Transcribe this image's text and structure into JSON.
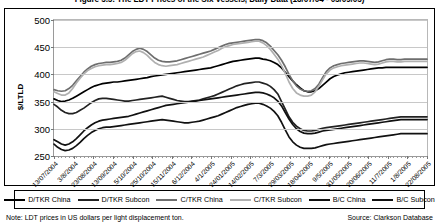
{
  "figure": {
    "title": "Figure 5.5: The LDT Prices of the Six Vessels, Daily Data (13/07/04 - 05/09/05)",
    "footnote_left": "Note: LDT prices in US dollars per light displacement ton.",
    "footnote_right": "Source: Clarkson Database"
  },
  "chart_data": {
    "type": "line",
    "title": "Figure 5.5: The LDT Prices of the Six Vessels, Daily Data (13/07/04 - 05/09/05)",
    "xlabel": "",
    "ylabel": "$/LTLD",
    "ylim": [
      250,
      500
    ],
    "yticks": [
      250,
      300,
      350,
      400,
      450,
      500
    ],
    "grid": true,
    "legend_position": "bottom",
    "x_tick_labels": [
      "13/07/2004",
      "3/8/2004",
      "23/08/2004",
      "13/09/2004",
      "5/10/2004",
      "25/10/2004",
      "15/11/2004",
      "6/12/2004",
      "4/1/2005",
      "24/01/2005",
      "14/02/2005",
      "7/3/2005",
      "29/03/2005",
      "18/04/2005",
      "9/5/2005",
      "31/05/2005",
      "20/06/2005",
      "11/7/2005",
      "1/8/2005",
      "22/08/2005"
    ],
    "x_tick_positions": [
      0,
      5.26,
      10.53,
      15.79,
      21.05,
      26.32,
      31.58,
      36.84,
      42.11,
      47.37,
      52.63,
      57.89,
      63.16,
      68.42,
      73.68,
      78.95,
      84.21,
      89.47,
      94.74,
      100
    ],
    "series": [
      {
        "name": "D/TKR China",
        "color": "#000000",
        "width": 1.7,
        "values": [
          355,
          352,
          350,
          351,
          353,
          356,
          360,
          364,
          368,
          372,
          376,
          379,
          381,
          383,
          384,
          385,
          386,
          386,
          387,
          388,
          389,
          390,
          391,
          392,
          393,
          394,
          396,
          397,
          398,
          399,
          400,
          401,
          402,
          403,
          404,
          405,
          406,
          407,
          408,
          409,
          410,
          411,
          412,
          414,
          416,
          418,
          420,
          422,
          424,
          425,
          426,
          427,
          428,
          429,
          430,
          430,
          428,
          427,
          425,
          422,
          418,
          412,
          404,
          396,
          388,
          381,
          375,
          370,
          368,
          368,
          370,
          374,
          380,
          386,
          392,
          396,
          399,
          401,
          403,
          404,
          405,
          406,
          407,
          408,
          409,
          410,
          411,
          412,
          412,
          413,
          413,
          413,
          413,
          413,
          413,
          413,
          413,
          413,
          413,
          413,
          413
        ]
      },
      {
        "name": "D/TKR Subcon",
        "color": "#222222",
        "width": 1.7,
        "values": [
          345,
          340,
          334,
          330,
          328,
          328,
          330,
          334,
          338,
          343,
          348,
          352,
          355,
          356,
          356,
          355,
          354,
          353,
          352,
          351,
          351,
          352,
          353,
          354,
          355,
          356,
          357,
          358,
          359,
          360,
          358,
          356,
          354,
          352,
          351,
          350,
          350,
          351,
          352,
          353,
          355,
          357,
          359,
          361,
          364,
          367,
          370,
          373,
          376,
          379,
          381,
          383,
          384,
          385,
          386,
          386,
          384,
          382,
          378,
          372,
          364,
          350,
          336,
          322,
          312,
          305,
          300,
          297,
          296,
          296,
          297,
          299,
          301,
          302,
          303,
          304,
          305,
          306,
          307,
          308,
          309,
          310,
          311,
          312,
          313,
          314,
          315,
          316,
          317,
          318,
          319,
          320,
          321,
          322,
          322,
          322,
          322,
          322,
          322,
          322,
          322
        ]
      },
      {
        "name": "C/TKR China",
        "color": "#6e6e6e",
        "width": 1.7,
        "values": [
          372,
          370,
          369,
          370,
          374,
          380,
          388,
          396,
          404,
          410,
          415,
          418,
          420,
          421,
          422,
          422,
          423,
          424,
          426,
          430,
          436,
          442,
          446,
          448,
          446,
          442,
          436,
          430,
          426,
          424,
          423,
          423,
          424,
          425,
          427,
          429,
          431,
          433,
          435,
          437,
          439,
          441,
          443,
          446,
          449,
          452,
          455,
          457,
          458,
          459,
          460,
          461,
          462,
          463,
          464,
          464,
          462,
          458,
          452,
          444,
          436,
          426,
          414,
          400,
          388,
          379,
          373,
          370,
          369,
          370,
          374,
          382,
          394,
          405,
          412,
          416,
          418,
          420,
          421,
          422,
          423,
          424,
          425,
          425,
          424,
          423,
          422,
          423,
          425,
          427,
          428,
          428,
          427,
          427,
          428,
          428,
          428,
          428,
          428,
          428,
          428
        ]
      },
      {
        "name": "C/TKR Subcon",
        "color": "#b0b0b0",
        "width": 1.7,
        "values": [
          368,
          365,
          362,
          362,
          366,
          374,
          384,
          393,
          401,
          407,
          411,
          414,
          416,
          417,
          418,
          418,
          419,
          420,
          422,
          426,
          432,
          438,
          442,
          443,
          440,
          435,
          428,
          422,
          418,
          416,
          415,
          416,
          417,
          418,
          420,
          422,
          424,
          426,
          428,
          430,
          432,
          435,
          438,
          441,
          444,
          448,
          451,
          453,
          455,
          456,
          457,
          458,
          459,
          460,
          461,
          461,
          458,
          453,
          446,
          437,
          428,
          416,
          402,
          386,
          374,
          366,
          362,
          360,
          360,
          362,
          368,
          378,
          390,
          401,
          408,
          412,
          414,
          416,
          417,
          418,
          419,
          420,
          421,
          421,
          420,
          419,
          418,
          419,
          421,
          423,
          424,
          424,
          423,
          423,
          424,
          424,
          424,
          424,
          424,
          424,
          424
        ]
      },
      {
        "name": "B/C China",
        "color": "#111111",
        "width": 1.7,
        "values": [
          280,
          276,
          272,
          270,
          272,
          276,
          282,
          289,
          296,
          302,
          307,
          311,
          314,
          316,
          317,
          318,
          319,
          320,
          321,
          322,
          323,
          325,
          327,
          329,
          331,
          333,
          335,
          337,
          339,
          341,
          343,
          344,
          345,
          346,
          347,
          348,
          349,
          350,
          351,
          352,
          353,
          354,
          355,
          356,
          357,
          358,
          359,
          360,
          361,
          362,
          363,
          364,
          365,
          366,
          367,
          367,
          366,
          364,
          361,
          357,
          351,
          342,
          330,
          318,
          308,
          300,
          295,
          292,
          291,
          291,
          292,
          294,
          296,
          297,
          298,
          299,
          300,
          301,
          302,
          303,
          304,
          305,
          306,
          307,
          308,
          309,
          310,
          311,
          312,
          313,
          314,
          315,
          316,
          317,
          317,
          317,
          317,
          317,
          317,
          317,
          317
        ]
      },
      {
        "name": "B/C Subcon",
        "color": "#111111",
        "width": 1.7,
        "values": [
          272,
          266,
          262,
          260,
          261,
          264,
          269,
          275,
          282,
          288,
          293,
          297,
          300,
          302,
          303,
          303,
          304,
          305,
          306,
          307,
          308,
          309,
          310,
          311,
          312,
          313,
          314,
          315,
          316,
          317,
          316,
          315,
          314,
          313,
          312,
          311,
          311,
          312,
          313,
          314,
          316,
          318,
          320,
          322,
          324,
          327,
          330,
          333,
          336,
          339,
          341,
          343,
          345,
          346,
          347,
          347,
          345,
          342,
          338,
          332,
          324,
          312,
          298,
          285,
          276,
          270,
          266,
          264,
          264,
          264,
          265,
          267,
          269,
          271,
          272,
          273,
          274,
          275,
          276,
          277,
          278,
          279,
          280,
          281,
          282,
          283,
          284,
          285,
          286,
          287,
          288,
          289,
          290,
          291,
          291,
          291,
          291,
          291,
          291,
          291,
          291
        ]
      }
    ]
  },
  "legend": {
    "items": [
      {
        "label": "D/TKR China",
        "color": "#000000"
      },
      {
        "label": "D/TKR Subcon",
        "color": "#222222"
      },
      {
        "label": "C/TKR China",
        "color": "#6e6e6e"
      },
      {
        "label": "C/TKR Subcon",
        "color": "#b0b0b0"
      },
      {
        "label": "B/C China",
        "color": "#111111"
      },
      {
        "label": "B/C Subcon",
        "color": "#111111"
      }
    ]
  }
}
